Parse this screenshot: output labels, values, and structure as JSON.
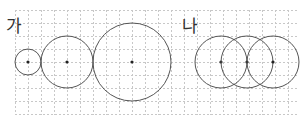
{
  "figure": {
    "panels": [
      {
        "label": "가",
        "label_pos": [
          6,
          18
        ],
        "arrangement": "tangent circles in increasing size",
        "circles": [
          {
            "cx": 28,
            "cy": 62,
            "r": 13
          },
          {
            "cx": 67,
            "cy": 62,
            "r": 26
          },
          {
            "cx": 132,
            "cy": 62,
            "r": 39
          }
        ]
      },
      {
        "label": "나",
        "label_pos": [
          182,
          18
        ],
        "arrangement": "three equal overlapping circles, each passing through neighbor's center",
        "circles": [
          {
            "cx": 221,
            "cy": 62,
            "r": 26
          },
          {
            "cx": 247,
            "cy": 62,
            "r": 26
          },
          {
            "cx": 273,
            "cy": 62,
            "r": 26
          }
        ]
      }
    ],
    "grid": {
      "x0": 15,
      "y0": 10,
      "x1": 297,
      "y1": 115,
      "step": 13,
      "color": "#c8c8c8",
      "dash": "2,2"
    },
    "colors": {
      "stroke": "#555555",
      "center_dot": "#222222",
      "label": "#333333"
    }
  }
}
